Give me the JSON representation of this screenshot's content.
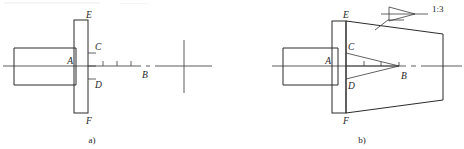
{
  "figure": {
    "type": "engineering-drawing",
    "background_color": "#ffffff",
    "line_color": "#2b2b2b",
    "axis_color": "#4a4a4a"
  },
  "diagram_a": {
    "caption": "a)",
    "labels": {
      "E": "E",
      "C": "C",
      "A": "A",
      "D": "D",
      "F": "F",
      "B": "B"
    },
    "axis": {
      "type": "center-line",
      "style": "dash-dot",
      "tick_count": 3
    },
    "center_mark": {
      "name": "cross-hair",
      "shape": "plus"
    },
    "parts": [
      {
        "name": "shaft-body",
        "shape": "rectangle"
      },
      {
        "name": "flange-plate",
        "shape": "rectangle-vertical"
      }
    ]
  },
  "diagram_b": {
    "caption": "b)",
    "labels": {
      "E": "E",
      "C": "C",
      "A": "A",
      "D": "D",
      "F": "F",
      "B": "B"
    },
    "taper_callout": {
      "symbol_name": "taper-symbol",
      "ratio_text": "1:3"
    },
    "axis": {
      "type": "center-line",
      "style": "dash-dot",
      "tick_count": 3
    },
    "parts": [
      {
        "name": "shaft-body",
        "shape": "rectangle"
      },
      {
        "name": "flange-plate",
        "shape": "rectangle-vertical"
      },
      {
        "name": "cone-outline",
        "shape": "trapezoid"
      },
      {
        "name": "inner-wedge",
        "shape": "triangle"
      }
    ]
  }
}
